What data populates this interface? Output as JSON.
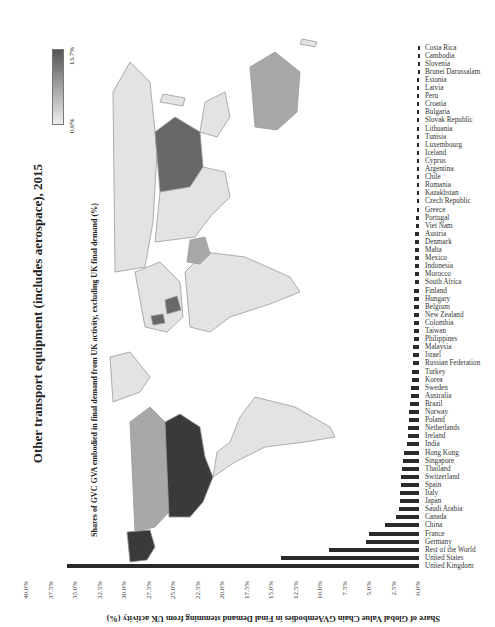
{
  "figure": {
    "title": "Other transport equipment (includes aerospace), 2015",
    "map_subtitle": "Shares of GVC GVA embodied in final demand from UK activity, excluding UK final demand (%)",
    "legend": {
      "min_label": "0.0%",
      "max_label": "13.7%",
      "min_color": "#eeeeee",
      "max_color": "#555555"
    },
    "map_colors": {
      "very_dark": "#3a3a3a",
      "dark": "#686868",
      "medium": "#a8a8a8",
      "light": "#e3e3e3",
      "border": "#9a9a9a"
    }
  },
  "chart_data": {
    "type": "bar",
    "title": "Other transport equipment (includes aerospace), 2015",
    "xlabel": "",
    "ylabel": "Share of Global Value Chain GVAembodies in Final Demand stemming from UK activity (%)",
    "ylim": [
      0,
      40
    ],
    "yticks": [
      "0.0%",
      "2.5%",
      "5.0%",
      "7.5%",
      "10.0%",
      "12.5%",
      "15.0%",
      "17.5%",
      "20.0%",
      "22.5%",
      "25.0%",
      "27.5%",
      "30.0%",
      "32.5%",
      "35.0%",
      "37.5%",
      "40.0%"
    ],
    "grid": false,
    "categories": [
      "United Kingdom",
      "United States",
      "Rest of the World",
      "Germany",
      "France",
      "China",
      "Canada",
      "Saudi Arabia",
      "Japan",
      "Italy",
      "Spain",
      "Switzerland",
      "Thailand",
      "Singapore",
      "Hong Kong",
      "India",
      "Ireland",
      "Netherlands",
      "Poland",
      "Norway",
      "Brazil",
      "Australia",
      "Sweden",
      "Korea",
      "Turkey",
      "Russian Federation",
      "Israel",
      "Malaysia",
      "Philippines",
      "Taiwan",
      "Colombia",
      "New Zealand",
      "Belgium",
      "Hungary",
      "Finland",
      "South Africa",
      "Morocco",
      "Indonesia",
      "Mexico",
      "Malta",
      "Denmark",
      "Austria",
      "Viet Nam",
      "Portugal",
      "Greece",
      "Czech Republic",
      "Kazakhstan",
      "Romania",
      "Chile",
      "Argentina",
      "Cyprus",
      "Iceland",
      "Luxembourg",
      "Tunisia",
      "Lithuania",
      "Slovak Republic",
      "Bulgaria",
      "Croatia",
      "Peru",
      "Latvia",
      "Estonia",
      "Brunei Darussalam",
      "Slovenia",
      "Cambodia",
      "Costa Rica"
    ],
    "values": [
      35.9,
      14.1,
      9.2,
      5.4,
      5.1,
      3.5,
      2.3,
      2.0,
      1.9,
      1.9,
      1.8,
      1.8,
      1.7,
      1.6,
      1.5,
      1.2,
      1.1,
      1.1,
      1.0,
      1.0,
      0.9,
      0.8,
      0.8,
      0.7,
      0.7,
      0.6,
      0.6,
      0.6,
      0.5,
      0.5,
      0.5,
      0.5,
      0.5,
      0.5,
      0.5,
      0.4,
      0.4,
      0.4,
      0.4,
      0.4,
      0.4,
      0.4,
      0.3,
      0.3,
      0.2,
      0.2,
      0.2,
      0.2,
      0.2,
      0.2,
      0.2,
      0.2,
      0.2,
      0.2,
      0.2,
      0.2,
      0.2,
      0.2,
      0.2,
      0.2,
      0.2,
      0.1,
      0.1,
      0.1,
      0.1
    ]
  }
}
